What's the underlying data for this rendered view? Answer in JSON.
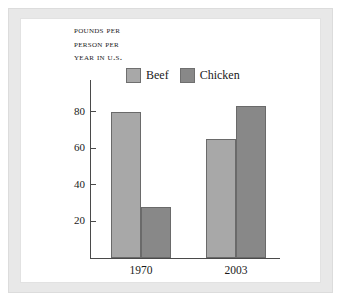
{
  "figure": {
    "background_color": "#ffffff",
    "mat_color": "#e8e8e8"
  },
  "chart_data": {
    "type": "bar",
    "title": "POUNDS PER PERSON PER YEAR IN U.S.",
    "title_lines": [
      "Pounds per",
      "person per",
      "year in U.S."
    ],
    "xlabel": "",
    "ylabel": "",
    "categories": [
      "1970",
      "2003"
    ],
    "series": [
      {
        "name": "Beef",
        "color": "#a8a8a8",
        "values": [
          80,
          65
        ]
      },
      {
        "name": "Chicken",
        "color": "#888888",
        "values": [
          28,
          83
        ]
      }
    ],
    "yticks": [
      20,
      40,
      60,
      80
    ],
    "ylim": [
      0,
      92
    ],
    "grid": false,
    "legend_position": "top"
  }
}
